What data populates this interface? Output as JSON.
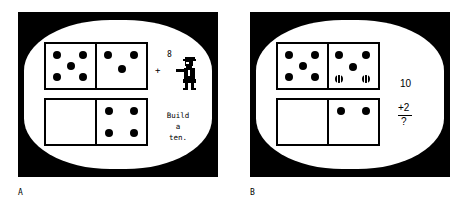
{
  "figure": {
    "background_color": "#ffffff",
    "ink_color": "#000000"
  },
  "panels": [
    {
      "caption": "A",
      "screen": {
        "tenframe": {
          "rows": [
            {
              "cells": [
                {
                  "name": "top-left",
                  "count": 5,
                  "dots": [
                    {
                      "x": 22,
                      "y": 24,
                      "state": "solid"
                    },
                    {
                      "x": 76,
                      "y": 24,
                      "state": "solid"
                    },
                    {
                      "x": 50,
                      "y": 50,
                      "state": "solid"
                    },
                    {
                      "x": 22,
                      "y": 76,
                      "state": "solid"
                    },
                    {
                      "x": 76,
                      "y": 76,
                      "state": "solid"
                    }
                  ]
                },
                {
                  "name": "top-right",
                  "count": 3,
                  "dots": [
                    {
                      "x": 24,
                      "y": 26,
                      "state": "solid"
                    },
                    {
                      "x": 76,
                      "y": 26,
                      "state": "solid"
                    },
                    {
                      "x": 52,
                      "y": 56,
                      "state": "solid"
                    }
                  ]
                }
              ]
            },
            {
              "cells": [
                {
                  "name": "bottom-left",
                  "count": 0,
                  "dots": []
                },
                {
                  "name": "bottom-right",
                  "count": 4,
                  "dots": [
                    {
                      "x": 26,
                      "y": 26,
                      "state": "solid"
                    },
                    {
                      "x": 76,
                      "y": 26,
                      "state": "solid"
                    },
                    {
                      "x": 26,
                      "y": 76,
                      "state": "solid"
                    },
                    {
                      "x": 76,
                      "y": 76,
                      "state": "solid"
                    }
                  ]
                }
              ]
            }
          ],
          "total_dots_shown": 12
        },
        "count_label": "8",
        "plus_sign": "+",
        "character": "teacher-figure",
        "instruction_lines": [
          "Build",
          "a",
          "ten."
        ]
      }
    },
    {
      "caption": "B",
      "screen": {
        "tenframe": {
          "rows": [
            {
              "cells": [
                {
                  "name": "top-left",
                  "count": 5,
                  "dots": [
                    {
                      "x": 22,
                      "y": 24,
                      "state": "solid"
                    },
                    {
                      "x": 76,
                      "y": 24,
                      "state": "solid"
                    },
                    {
                      "x": 50,
                      "y": 50,
                      "state": "solid"
                    },
                    {
                      "x": 22,
                      "y": 76,
                      "state": "solid"
                    },
                    {
                      "x": 76,
                      "y": 76,
                      "state": "solid"
                    }
                  ]
                },
                {
                  "name": "top-right",
                  "count": 5,
                  "dots": [
                    {
                      "x": 22,
                      "y": 24,
                      "state": "solid"
                    },
                    {
                      "x": 76,
                      "y": 24,
                      "state": "solid"
                    },
                    {
                      "x": 50,
                      "y": 52,
                      "state": "solid"
                    },
                    {
                      "x": 22,
                      "y": 79,
                      "state": "flashing"
                    },
                    {
                      "x": 76,
                      "y": 79,
                      "state": "flashing"
                    }
                  ]
                }
              ]
            },
            {
              "cells": [
                {
                  "name": "bottom-left",
                  "count": 0,
                  "dots": []
                },
                {
                  "name": "bottom-right",
                  "count": 2,
                  "dots": [
                    {
                      "x": 26,
                      "y": 26,
                      "state": "solid"
                    },
                    {
                      "x": 76,
                      "y": 26,
                      "state": "solid"
                    }
                  ]
                }
              ]
            }
          ],
          "total_dots_shown": 12
        },
        "math": {
          "total": "10",
          "addend": "+2",
          "answer": "?"
        }
      }
    }
  ]
}
